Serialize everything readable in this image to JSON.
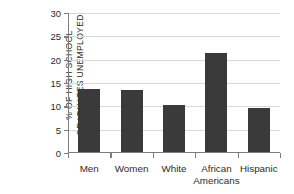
{
  "chart_data": {
    "type": "bar",
    "title": "",
    "subtitle": "",
    "xlabel": "",
    "ylabel": "% OF HIGH SCHOOL GRADUATES UNEMPLOYED",
    "ylabel_lines": [
      "% OF HIGH SCHOOL",
      "GRADUATES UNEMPLOYED"
    ],
    "categories": [
      "Men",
      "Women",
      "White",
      "African Americans",
      "Hispanic"
    ],
    "category_lines": [
      [
        "Men"
      ],
      [
        "Women"
      ],
      [
        "White"
      ],
      [
        "African",
        "Americans"
      ],
      [
        "Hispanic"
      ]
    ],
    "values": [
      13.5,
      13.2,
      10.0,
      21.3,
      9.5
    ],
    "ylim": [
      0,
      30
    ],
    "ytick_values": [
      0,
      5,
      10,
      15,
      20,
      25,
      30
    ],
    "ytick_labels": [
      "0",
      "5",
      "10",
      "15",
      "20",
      "25",
      "30"
    ],
    "grid": true,
    "grid_axis": "y",
    "legend": false,
    "legend_position": "none",
    "bar_color": "#3a3a3a",
    "grid_color": "#d8d8d8",
    "axis_color": "#7d7d7d",
    "background_color": "#ffffff"
  }
}
